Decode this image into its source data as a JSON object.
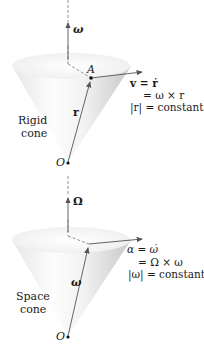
{
  "figure": {
    "panels": [
      {
        "name": "rigid-cone",
        "axis_label": "ω",
        "point_label": "A",
        "apex_label": "O",
        "radius_label": "r",
        "cone_caption": [
          "Rigid",
          "cone"
        ],
        "equations": [
          "v = ṙ",
          "= ω × r",
          "|r| = constant"
        ]
      },
      {
        "name": "space-cone",
        "axis_label": "Ω",
        "point_label": "",
        "apex_label": "O",
        "radius_label": "ω",
        "cone_caption": [
          "Space",
          "cone"
        ],
        "equations": [
          "α = ω̇",
          "= Ω × ω",
          "|ω| = constant"
        ]
      }
    ],
    "colors": {
      "line": "#555555",
      "cone_light": "#ffffff",
      "cone_shade": "#cfcfcf",
      "text": "#1a1a1a"
    }
  }
}
